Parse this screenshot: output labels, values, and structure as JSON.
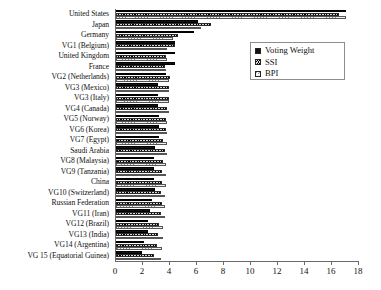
{
  "chart_data": {
    "type": "bar",
    "orientation": "horizontal",
    "title": "",
    "xlabel": "",
    "ylabel": "",
    "xlim": [
      0,
      18
    ],
    "xticks": [
      0,
      2,
      4,
      6,
      8,
      10,
      12,
      14,
      16,
      18
    ],
    "grid": false,
    "legend_position": "upper-right",
    "categories": [
      "United States",
      "Japan",
      "Germany",
      "VG1 (Belgium)",
      "United Kingdom",
      "France",
      "VG2 (Netherlands)",
      "VG3 (Mexico)",
      "VG3 (Italy)",
      "VG4 (Canada)",
      "VG5 (Norway)",
      "VG6 (Korea)",
      "VG7 (Egypt)",
      "Saudi Arabia",
      "VG8 (Malaysia)",
      "VG9 (Tanzania)",
      "China",
      "VG10 (Switzerland)",
      "Russian Federation",
      "VG11 (Iran)",
      "VG12 (Brazil)",
      "VG13 (India)",
      "VG14 (Argentina)",
      "VG 15 (Equatorial Guinea)"
    ],
    "series": [
      {
        "name": "Voting Weight",
        "style": "solid-black",
        "color": "#111111",
        "values": [
          17.0,
          6.1,
          5.8,
          4.4,
          4.4,
          4.4,
          3.7,
          3.1,
          3.1,
          3.1,
          3.2,
          3.2,
          3.2,
          2.9,
          2.8,
          2.8,
          2.8,
          2.9,
          2.7,
          2.5,
          2.4,
          2.4,
          2.1,
          1.9
        ],
        "legend_label": "Voting Weight"
      },
      {
        "name": "SSI",
        "style": "dense-hatch",
        "color": "#c9c9c9",
        "values": [
          16.5,
          7.0,
          4.6,
          4.4,
          3.7,
          3.6,
          4.0,
          3.9,
          3.9,
          3.8,
          3.7,
          3.7,
          3.5,
          3.6,
          3.5,
          3.4,
          3.4,
          3.3,
          3.4,
          3.3,
          3.2,
          3.1,
          3.0,
          2.8
        ],
        "legend_label": "SSI"
      },
      {
        "name": "BPI",
        "style": "light-hatch",
        "color": "#eaeaea",
        "values": [
          17.0,
          6.3,
          4.2,
          3.8,
          3.8,
          3.7,
          3.9,
          3.9,
          3.9,
          3.9,
          3.8,
          3.8,
          3.8,
          3.8,
          3.7,
          3.7,
          3.7,
          3.6,
          3.6,
          3.6,
          3.5,
          3.5,
          3.4,
          3.3
        ],
        "legend_label": "BPI"
      }
    ]
  },
  "legend": {
    "items": [
      {
        "label": "Voting Weight",
        "swatch": "vw"
      },
      {
        "label": "SSI",
        "swatch": "ssi"
      },
      {
        "label": "BPI",
        "swatch": "bpi"
      }
    ]
  }
}
